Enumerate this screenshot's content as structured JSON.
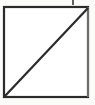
{
  "figure": {
    "background_color": "#fbfbf9",
    "stroke_color": "#2b2b2b",
    "stroke_color_light": "#555555",
    "canvas": {
      "width": 95,
      "height": 105
    },
    "shapes": {
      "square": {
        "name": "square-outline",
        "x": 4,
        "y": 7,
        "width": 84,
        "height": 90,
        "stroke_width": 2.2
      },
      "diagonal": {
        "name": "diagonal-line",
        "x1": 5,
        "y1": 96,
        "x2": 88,
        "y2": 8,
        "stroke_width": 2.2
      },
      "tick": {
        "name": "tick-mark",
        "x1": 73,
        "y1": 0,
        "x2": 73,
        "y2": 5,
        "stroke_width": 1.6
      }
    },
    "labels": {
      "vertex_bottom_left": "",
      "vertex_top_right": "",
      "caption": ""
    }
  }
}
